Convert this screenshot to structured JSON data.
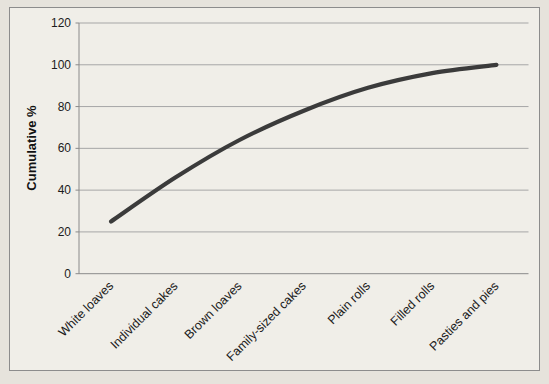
{
  "chart_data": {
    "type": "line",
    "title": "",
    "xlabel": "",
    "ylabel": "Cumulative %",
    "categories": [
      "White loaves",
      "Individual cakes",
      "Brown loaves",
      "Family-sized cakes",
      "Plain rolls",
      "Filled rolls",
      "Pasties and pies"
    ],
    "series": [
      {
        "name": "Cumulative %",
        "values": [
          25,
          46,
          64,
          78,
          89,
          96,
          100
        ]
      }
    ],
    "ylim": [
      0,
      120
    ],
    "yticks": [
      0,
      20,
      40,
      60,
      80,
      100,
      120
    ],
    "grid": true,
    "legend_position": "none",
    "line_smooth": true,
    "x_label_rotation_deg": -45,
    "colors": {
      "line": "#3b3b3b",
      "gridline": "#a6a6a6",
      "axis": "#8a8a8a",
      "text": "#1c1c1c",
      "chart_background": "#f0eee8",
      "page_background": "#e6e3dc",
      "chart_border": "#8c8c8c"
    }
  }
}
